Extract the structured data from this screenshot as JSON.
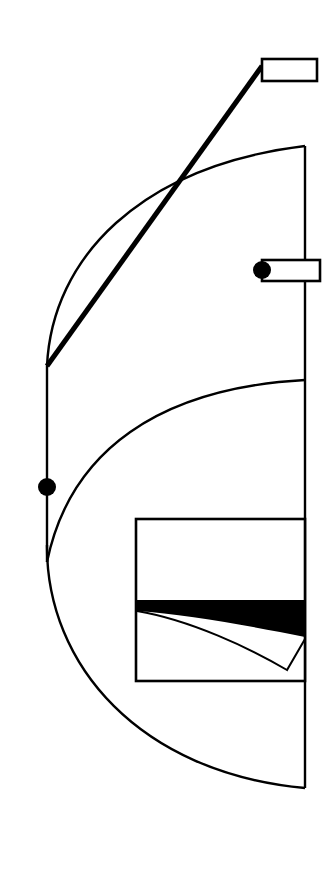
{
  "figure": {
    "kind": "patent-style-line-art",
    "canvas": {
      "width": 332,
      "height": 876
    },
    "colors": {
      "background": "#ffffff",
      "ink": "#000000",
      "fill_solid": "#000000"
    },
    "callouts": [
      {
        "id": "callout-top",
        "label": "",
        "box": {
          "x": 262,
          "y": 59,
          "width": 55,
          "height": 22
        },
        "leader": {
          "x1": 262,
          "y1": 70,
          "x2": 47,
          "y2": 366
        },
        "has_terminal_dot": false
      },
      {
        "id": "callout-middle",
        "label": "",
        "box": {
          "x": 262,
          "y": 260,
          "width": 58,
          "height": 21
        },
        "has_terminal_dot": true,
        "dot": {
          "cx": 262,
          "cy": 270,
          "r": 9
        }
      }
    ],
    "markers": [
      {
        "id": "node-dot-left",
        "cx": 47,
        "cy": 487,
        "r": 9
      }
    ],
    "outline_paths": {
      "left_vertical": {
        "x": 47,
        "y1": 366,
        "y2": 562
      },
      "right_vertical": {
        "x": 305,
        "y1": 146,
        "y2": 788
      },
      "upper_arc": {
        "from": [
          47,
          366
        ],
        "to": [
          305,
          146
        ]
      },
      "lower_arc": {
        "from": [
          305,
          380
        ],
        "to": [
          47,
          562
        ]
      },
      "bottom_arc": {
        "from": [
          47,
          545
        ],
        "to": [
          305,
          788
        ]
      }
    },
    "inner_panel": {
      "id": "inner-rectangle",
      "x": 136,
      "y": 519,
      "width": 169,
      "height": 162,
      "band": {
        "id": "solid-black-wedge",
        "top_y": 600,
        "left_bottom_y": 610,
        "right_bottom_y": 637
      },
      "sliver_curve": {
        "from": [
          137,
          611
        ],
        "vertex": [
          287,
          670
        ],
        "to": [
          305,
          639
        ]
      }
    }
  }
}
